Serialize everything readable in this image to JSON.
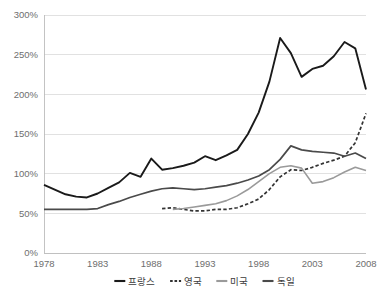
{
  "chart_data": {
    "type": "line",
    "title": "",
    "subtitle": "",
    "xlabel": "",
    "ylabel": "",
    "xlim": [
      1978,
      2008
    ],
    "ylim": [
      0,
      300
    ],
    "grid": true,
    "legend_position": "bottom",
    "x_ticks": [
      "1978",
      "1983",
      "1988",
      "1993",
      "1998",
      "2003",
      "2008"
    ],
    "x_tick_values": [
      1978,
      1983,
      1988,
      1993,
      1998,
      2003,
      2008
    ],
    "y_ticks": [
      "0%",
      "50%",
      "100%",
      "150%",
      "200%",
      "250%",
      "300%"
    ],
    "y_tick_values": [
      0,
      50,
      100,
      150,
      200,
      250,
      300
    ],
    "x": [
      1978,
      1979,
      1980,
      1981,
      1982,
      1983,
      1984,
      1985,
      1986,
      1987,
      1988,
      1989,
      1990,
      1991,
      1992,
      1993,
      1994,
      1995,
      1996,
      1997,
      1998,
      1999,
      2000,
      2001,
      2002,
      2003,
      2004,
      2005,
      2006,
      2007,
      2008
    ],
    "series": [
      {
        "name": "프랑스",
        "color": "#1a1a1a",
        "style": "solid",
        "width": 1.9,
        "x": [
          1978,
          1979,
          1980,
          1981,
          1982,
          1983,
          1984,
          1985,
          1986,
          1987,
          1988,
          1989,
          1990,
          1991,
          1992,
          1993,
          1994,
          1995,
          1996,
          1997,
          1998,
          1999,
          2000,
          2001,
          2002,
          2003,
          2004,
          2005,
          2006,
          2007,
          2008
        ],
        "values": [
          86,
          80,
          74,
          71,
          70,
          75,
          82,
          89,
          101,
          96,
          119,
          105,
          107,
          110,
          114,
          122,
          117,
          123,
          130,
          150,
          177,
          216,
          271,
          252,
          222,
          232,
          236,
          248,
          266,
          258,
          206
        ]
      },
      {
        "name": "영국",
        "color": "#333333",
        "style": "dashed",
        "width": 1.7,
        "x": [
          1989,
          1990,
          1991,
          1992,
          1993,
          1994,
          1995,
          1996,
          1997,
          1998,
          1999,
          2000,
          2001,
          2002,
          2003,
          2004,
          2005,
          2006,
          2007,
          2008
        ],
        "values": [
          56,
          57,
          55,
          53,
          53,
          55,
          55,
          57,
          62,
          68,
          80,
          96,
          105,
          104,
          108,
          113,
          117,
          122,
          139,
          176
        ]
      },
      {
        "name": "미국",
        "color": "#9a9a9a",
        "style": "solid",
        "width": 1.6,
        "x": [
          1990,
          1991,
          1992,
          1993,
          1994,
          1995,
          1996,
          1997,
          1998,
          1999,
          2000,
          2001,
          2002,
          2003,
          2004,
          2005,
          2006,
          2007,
          2008
        ],
        "values": [
          55,
          56,
          58,
          60,
          62,
          66,
          72,
          80,
          90,
          100,
          108,
          110,
          107,
          88,
          90,
          95,
          102,
          108,
          104
        ]
      },
      {
        "name": "독일",
        "color": "#4a4a4a",
        "style": "solid",
        "width": 1.7,
        "x": [
          1978,
          1979,
          1980,
          1981,
          1982,
          1983,
          1984,
          1985,
          1986,
          1987,
          1988,
          1989,
          1990,
          1991,
          1992,
          1993,
          1994,
          1995,
          1996,
          1997,
          1998,
          1999,
          2000,
          2001,
          2002,
          2003,
          2004,
          2005,
          2006,
          2007,
          2008
        ],
        "values": [
          55,
          55,
          55,
          55,
          55,
          56,
          61,
          65,
          70,
          74,
          78,
          81,
          82,
          81,
          80,
          81,
          83,
          85,
          88,
          92,
          97,
          105,
          118,
          135,
          130,
          128,
          127,
          126,
          122,
          126,
          119
        ]
      }
    ],
    "legend": [
      {
        "label": "프랑스",
        "color": "#1a1a1a",
        "style": "solid"
      },
      {
        "label": "영국",
        "color": "#333333",
        "style": "dashed"
      },
      {
        "label": "미국",
        "color": "#9a9a9a",
        "style": "solid"
      },
      {
        "label": "독일",
        "color": "#4a4a4a",
        "style": "solid"
      }
    ],
    "colors": {
      "gridline": "#d9d9d9",
      "axis": "#bdbdbd",
      "tick_text": "#6e6e6e",
      "legend_text": "#3a3a3a",
      "background": "#ffffff"
    }
  }
}
